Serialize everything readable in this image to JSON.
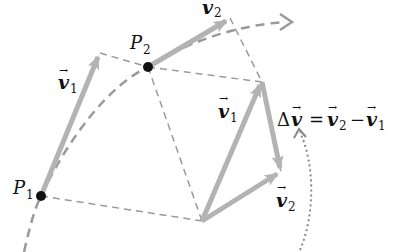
{
  "diagram": {
    "colors": {
      "vector": "#b3b3b3",
      "dashed": "#9a9a9a",
      "point": "#111111",
      "dotted": "#888888",
      "text": "#111111"
    },
    "points": [
      {
        "name": "P",
        "sub": "1",
        "x": 41,
        "y": 196
      },
      {
        "name": "P",
        "sub": "2",
        "x": 148,
        "y": 67
      }
    ],
    "labels": {
      "v1_path": {
        "sym": "v",
        "sub": "1"
      },
      "v2_path": {
        "sym": "v",
        "sub": "2"
      },
      "v1_triangle": {
        "sym": "v",
        "sub": "1"
      },
      "v2_triangle": {
        "sym": "v",
        "sub": "2"
      },
      "equation": {
        "delta": "Δ",
        "v": "v",
        "eq": "=",
        "v2": "v",
        "sub2": "2",
        "minus": "−",
        "v1": "v",
        "sub1": "1"
      },
      "arrow_mark": "→"
    }
  }
}
